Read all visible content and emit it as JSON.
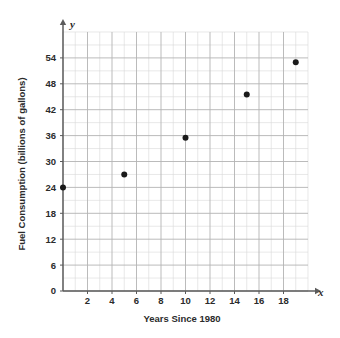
{
  "chart_data": {
    "type": "scatter",
    "title": "",
    "xlabel": "Years Since 1980",
    "ylabel": "Fuel Consumption (billions of gallons)",
    "x_axis_letter": "x",
    "y_axis_letter": "y",
    "xlim": [
      0,
      20
    ],
    "ylim": [
      0,
      60
    ],
    "x_tick_labels": [
      "2",
      "4",
      "6",
      "8",
      "10",
      "12",
      "14",
      "16",
      "18"
    ],
    "x_tick_values": [
      2,
      4,
      6,
      8,
      10,
      12,
      14,
      16,
      18
    ],
    "y_tick_labels": [
      "0",
      "6",
      "12",
      "18",
      "24",
      "30",
      "36",
      "42",
      "48",
      "54"
    ],
    "y_tick_values": [
      0,
      6,
      12,
      18,
      24,
      30,
      36,
      42,
      48,
      54
    ],
    "x_minor_step": 1,
    "y_minor_step": 3,
    "grid": true,
    "grid_color": "#b3b3b3",
    "minor_grid_color": "#d9d9d9",
    "axis_color": "#5b5b5b",
    "point_color": "#1a1a1a",
    "point_radius": 3,
    "legend": "none",
    "points": [
      {
        "x": 0,
        "y": 24
      },
      {
        "x": 5,
        "y": 27
      },
      {
        "x": 10,
        "y": 35.5
      },
      {
        "x": 15,
        "y": 45.5
      },
      {
        "x": 19,
        "y": 53
      }
    ]
  }
}
